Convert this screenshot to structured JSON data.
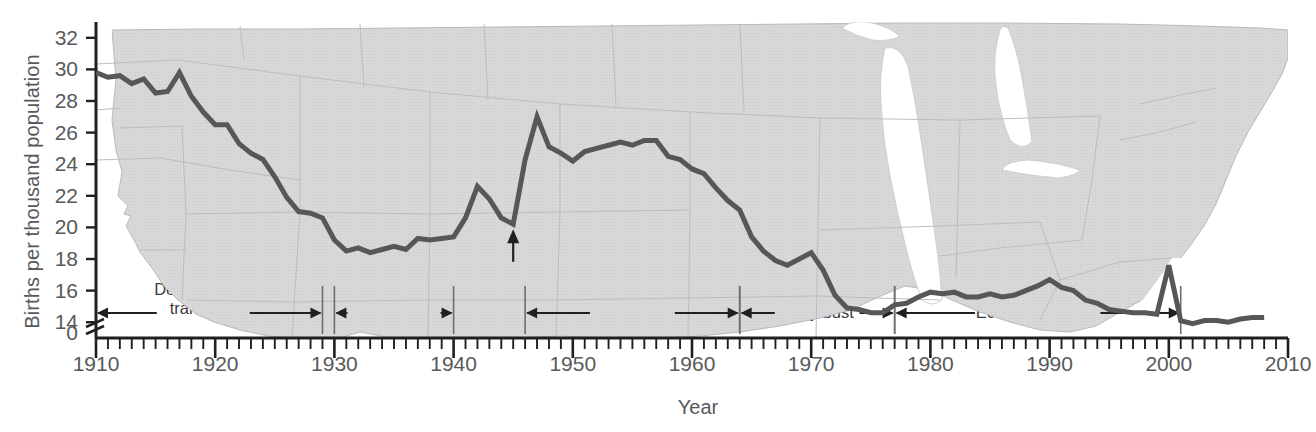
{
  "chart_data": {
    "type": "line",
    "title": "",
    "xlabel": "Year",
    "ylabel": "Births per thousand population",
    "xlim": [
      1910,
      2010
    ],
    "ylim": [
      13.0,
      33.0
    ],
    "y_axis_break": true,
    "y_axis_break_label": "0",
    "grid": false,
    "legend": null,
    "x_major_step": 10,
    "x_minor_step": 1,
    "y_tick_step": 2,
    "xticks": [
      1910,
      1920,
      1930,
      1940,
      1950,
      1960,
      1970,
      1980,
      1990,
      2000,
      2010
    ],
    "xtick_labels": [
      "1910",
      "1920",
      "1930",
      "1940",
      "1950",
      "1960",
      "1970",
      "1980",
      "1990",
      "2000",
      "2010"
    ],
    "yticks": [
      14,
      16,
      18,
      20,
      22,
      24,
      26,
      28,
      30,
      32
    ],
    "ytick_labels": [
      "14",
      "16",
      "18",
      "20",
      "22",
      "24",
      "26",
      "28",
      "30",
      "32"
    ],
    "line_color": "#555759",
    "line_width": 5,
    "background": "faint-us-state-map",
    "x": [
      1910,
      1911,
      1912,
      1913,
      1914,
      1915,
      1916,
      1917,
      1918,
      1919,
      1920,
      1921,
      1922,
      1923,
      1924,
      1925,
      1926,
      1927,
      1928,
      1929,
      1930,
      1931,
      1932,
      1933,
      1934,
      1935,
      1936,
      1937,
      1938,
      1939,
      1940,
      1941,
      1942,
      1943,
      1944,
      1945,
      1946,
      1947,
      1948,
      1949,
      1950,
      1951,
      1952,
      1953,
      1954,
      1955,
      1956,
      1957,
      1958,
      1959,
      1960,
      1961,
      1962,
      1963,
      1964,
      1965,
      1966,
      1967,
      1968,
      1969,
      1970,
      1971,
      1972,
      1973,
      1974,
      1975,
      1976,
      1977,
      1978,
      1979,
      1980,
      1981,
      1982,
      1983,
      1984,
      1985,
      1986,
      1987,
      1988,
      1989,
      1990,
      1991,
      1992,
      1993,
      1994,
      1995,
      1996,
      1997,
      1998,
      1999,
      2000,
      2001,
      2002,
      2003,
      2004,
      2005,
      2006,
      2007,
      2008
    ],
    "y": [
      29.8,
      29.5,
      29.6,
      29.1,
      29.4,
      28.5,
      28.6,
      29.8,
      28.3,
      27.3,
      26.5,
      26.5,
      25.3,
      24.7,
      24.3,
      23.2,
      21.9,
      21.0,
      20.9,
      20.6,
      19.2,
      18.5,
      18.7,
      18.4,
      18.6,
      18.8,
      18.6,
      19.3,
      19.2,
      19.3,
      19.4,
      20.6,
      22.6,
      21.8,
      20.6,
      20.2,
      24.3,
      27.0,
      25.1,
      24.7,
      24.2,
      24.8,
      25.0,
      25.2,
      25.4,
      25.2,
      25.5,
      25.5,
      24.5,
      24.3,
      23.7,
      23.4,
      22.5,
      21.7,
      21.1,
      19.4,
      18.5,
      17.9,
      17.6,
      18.0,
      18.4,
      17.3,
      15.7,
      14.9,
      14.8,
      14.6,
      14.6,
      15.1,
      15.2,
      15.6,
      15.9,
      15.8,
      15.9,
      15.6,
      15.6,
      15.8,
      15.6,
      15.7,
      16.0,
      16.3,
      16.7,
      16.2,
      16.0,
      15.4,
      15.2,
      14.8,
      14.7,
      14.6,
      14.6,
      14.5,
      17.6,
      14.1,
      13.9,
      14.1,
      14.1,
      14.0,
      14.2,
      14.3,
      14.3
    ],
    "annotations": [
      {
        "name": "demographic-transition",
        "label_line1": "Demographic",
        "label_line2": "transition",
        "span_start": 1910,
        "span_end": 1929,
        "label_center": 1919
      },
      {
        "name": "depression",
        "label_line1": "Depression",
        "label_line2": "",
        "span_start": 1930,
        "span_end": 1940,
        "label_center": 1935
      },
      {
        "name": "baby-boom",
        "label_line1": "Baby boom",
        "label_line2": "",
        "span_start": 1946,
        "span_end": 1964,
        "label_center": 1955
      },
      {
        "name": "baby-bust",
        "label_line1": "Baby bust",
        "label_line2": "",
        "span_start": 1964,
        "span_end": 1977,
        "label_center": 1970.5
      },
      {
        "name": "echo-baby-boom",
        "label_line1": "Echo baby boom",
        "label_line2": "",
        "span_start": 1977,
        "span_end": 2001,
        "label_center": 1989
      }
    ],
    "callouts": [
      {
        "name": "end-of-world-war-ii",
        "label": "End of World War II",
        "point_x": 1945,
        "point_y": 20.2,
        "label_x": 1945,
        "label_y": 17.0
      }
    ]
  }
}
